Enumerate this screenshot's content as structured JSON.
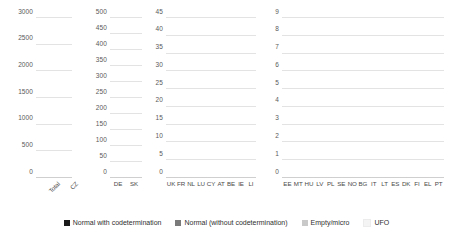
{
  "chart_data": {
    "type": "bar",
    "title": "",
    "subtitle": "",
    "xlabel": "",
    "ylabel": "",
    "stacked": true,
    "grid": true,
    "legend_position": "bottom",
    "series_names": [
      "Normal with codetermination",
      "Normal (without codetermination)",
      "Empty/micro",
      "UFO"
    ],
    "series_colors": [
      "#1a1a1a",
      "#7a7a7a",
      "#c9c9c9",
      "#f2f2f2"
    ],
    "panels": [
      {
        "name": "panel-total",
        "ylim": [
          0,
          3000
        ],
        "yticks": [
          0,
          500,
          1000,
          1500,
          2000,
          2500,
          3000
        ],
        "ytick_labels": [
          "0",
          "500",
          "1000",
          "1500",
          "2000",
          "2500",
          "3000"
        ],
        "categories": [
          "Total",
          "CZ"
        ],
        "rotated_labels": true,
        "series": [
          {
            "name": "Normal with codetermination",
            "values": [
              95,
              0
            ]
          },
          {
            "name": "Normal (without codetermination)",
            "values": [
              345,
              230
            ]
          },
          {
            "name": "Empty/micro",
            "values": [
              420,
              180
            ]
          },
          {
            "name": "UFO",
            "values": [
              0,
              0
            ]
          }
        ],
        "totals": [
          860,
          410
        ]
      },
      {
        "name": "panel-de-sk",
        "ylim": [
          0,
          500
        ],
        "yticks": [
          0,
          50,
          100,
          150,
          200,
          250,
          300,
          350,
          400,
          450,
          500
        ],
        "ytick_labels": [
          "0",
          "50",
          "100",
          "150",
          "200",
          "250",
          "300",
          "350",
          "400",
          "450",
          "500"
        ],
        "categories": [
          "DE",
          "SK"
        ],
        "rotated_labels": false,
        "series": [
          {
            "name": "Normal with codetermination",
            "values": [
              60,
              0
            ]
          },
          {
            "name": "Normal (without codetermination)",
            "values": [
              175,
              20
            ]
          },
          {
            "name": "Empty/micro",
            "values": [
              70,
              110
            ]
          },
          {
            "name": "UFO",
            "values": [
              0,
              0
            ]
          }
        ],
        "totals": [
          305,
          130
        ]
      },
      {
        "name": "panel-uk-li",
        "ylim": [
          0,
          45
        ],
        "yticks": [
          0,
          5,
          10,
          15,
          20,
          25,
          30,
          35,
          40,
          45
        ],
        "ytick_labels": [
          "0",
          "5",
          "10",
          "15",
          "20",
          "25",
          "30",
          "35",
          "40",
          "45"
        ],
        "categories": [
          "UK",
          "FR",
          "NL",
          "LU",
          "CY",
          "AT",
          "BE",
          "IE",
          "LI"
        ],
        "rotated_labels": false,
        "series": [
          {
            "name": "Normal with codetermination",
            "values": [
              0,
              11,
              0,
              0,
              1,
              2,
              0,
              0,
              0
            ]
          },
          {
            "name": "Normal (without codetermination)",
            "values": [
              14,
              15,
              17,
              11,
              8,
              9,
              4,
              2,
              3
            ]
          },
          {
            "name": "Empty/micro",
            "values": [
              25,
              4,
              8,
              11,
              4,
              8,
              2,
              2,
              1
            ]
          },
          {
            "name": "UFO",
            "values": [
              0,
              0,
              0,
              0,
              0,
              0,
              0,
              0,
              0
            ]
          }
        ],
        "totals": [
          39,
          30,
          25,
          22,
          13,
          19,
          6,
          4,
          4
        ]
      },
      {
        "name": "panel-ee-pt",
        "ylim": [
          0,
          9
        ],
        "yticks": [
          0,
          1,
          2,
          3,
          4,
          5,
          6,
          7,
          8,
          9
        ],
        "ytick_labels": [
          "0",
          "1",
          "2",
          "3",
          "4",
          "5",
          "6",
          "7",
          "8",
          "9"
        ],
        "categories": [
          "EE",
          "MT",
          "HU",
          "LV",
          "PL",
          "SE",
          "NO",
          "BG",
          "IT",
          "LT",
          "ES",
          "DK",
          "FI",
          "EL",
          "PT"
        ],
        "rotated_labels": false,
        "series": [
          {
            "name": "Normal with codetermination",
            "values": [
              0,
              0,
              1,
              0,
              0,
              0,
              0,
              0,
              0,
              0,
              0,
              0,
              0,
              0,
              0
            ]
          },
          {
            "name": "Normal (without codetermination)",
            "values": [
              7,
              0,
              4,
              3,
              2,
              2,
              2,
              1,
              1,
              1,
              0,
              1,
              1,
              0,
              0
            ]
          },
          {
            "name": "Empty/micro",
            "values": [
              0,
              4,
              0,
              1,
              0,
              0,
              2,
              0,
              0,
              0,
              1,
              0,
              0,
              1,
              1
            ]
          },
          {
            "name": "UFO",
            "values": [
              0,
              0,
              0,
              0,
              0,
              0,
              0,
              0,
              0,
              0,
              0,
              0,
              0,
              0,
              0
            ]
          }
        ],
        "totals": [
          7,
          4,
          5,
          4,
          2,
          2,
          4,
          1,
          1,
          1,
          1,
          1,
          1,
          1,
          1
        ]
      }
    ]
  },
  "legend": {
    "items": [
      {
        "label": "Normal with codetermination",
        "color": "#1a1a1a"
      },
      {
        "label": "Normal (without codetermination)",
        "color": "#7a7a7a"
      },
      {
        "label": "Empty/micro",
        "color": "#c9c9c9"
      },
      {
        "label": "UFO",
        "color": "#f4f4f4"
      }
    ]
  }
}
